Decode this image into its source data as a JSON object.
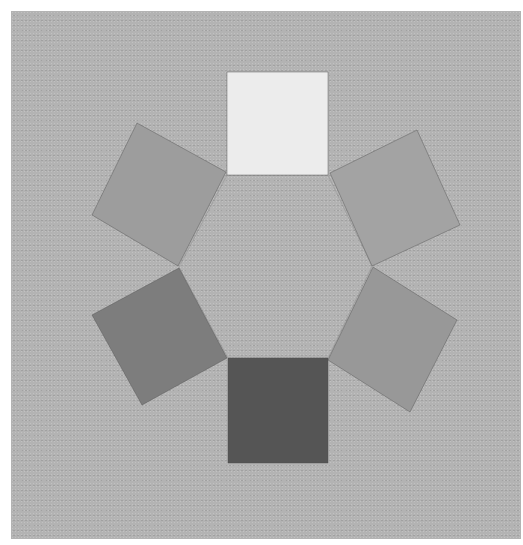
{
  "figure": {
    "type": "value-wheel",
    "background_color": "#b3b3b3",
    "margin_color": "#ffffff",
    "center_shape": "hexagon",
    "swatches": [
      {
        "position": "top",
        "color": "#ececec",
        "points": "227,72 328,72 328,175 227,175"
      },
      {
        "position": "upper-right",
        "color": "#a3a3a3",
        "points": "330,173 417,130 460,225 372,266"
      },
      {
        "position": "lower-right",
        "color": "#989898",
        "points": "373,267 457,320 410,412 328,360"
      },
      {
        "position": "bottom",
        "color": "#555555",
        "points": "228,358 328,358 328,463 228,463"
      },
      {
        "position": "lower-left",
        "color": "#7d7d7d",
        "points": "179,268 227,358 142,405 92,315"
      },
      {
        "position": "upper-left",
        "color": "#9d9d9d",
        "points": "137,123 226,172 178,266 92,215"
      }
    ],
    "hexagon_points": "227,175 328,175 372,266 328,358 228,358 179,267"
  }
}
